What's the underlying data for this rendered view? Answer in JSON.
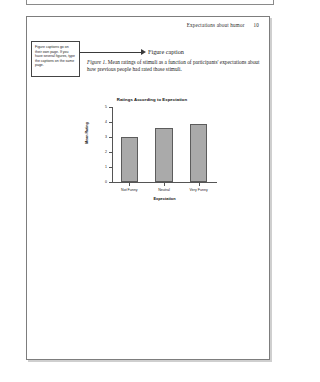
{
  "document": {
    "running_head": "Expectations about humor",
    "page_number": "10"
  },
  "callout": {
    "note_text": "Figure captions go on their own page. If you have several figures, type the captions on the same page.",
    "label": "Figure caption"
  },
  "caption": {
    "figure_number": "Figure 1",
    "text": ". Mean ratings of stimuli as a function of participants' expectations about how previous people had rated those stimuli."
  },
  "chart_data": {
    "type": "bar",
    "title": "Ratings According to Expectation",
    "xlabel": "Expectation",
    "ylabel": "Mean Rating",
    "categories": [
      "Not Funny",
      "Neutral",
      "Very Funny"
    ],
    "values": [
      3.0,
      3.6,
      3.9
    ],
    "ylim": [
      0,
      5
    ],
    "yticks": [
      0,
      1,
      2,
      3,
      4,
      5
    ],
    "ytick_labels": [
      "0",
      "1",
      "2",
      "3",
      "4",
      "5"
    ],
    "grid": false,
    "legend": "none",
    "bar_color": "#aaaaaa",
    "bar_edge_color": "#5c5c5c"
  }
}
